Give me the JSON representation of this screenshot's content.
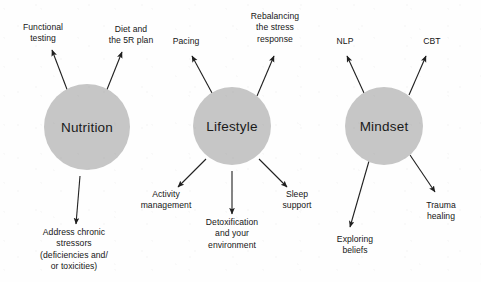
{
  "diagram": {
    "type": "radial-cluster",
    "title_visible": false,
    "background_color": "#fefefe",
    "node_fill_color": "#c6c6c6",
    "text_color": "#161616",
    "arrow_color": "#1f1f1f",
    "clusters": [
      {
        "id": "nutrition",
        "center_label": "Nutrition",
        "center": {
          "x": 87,
          "y": 127
        },
        "radius": 43,
        "branches": [
          {
            "id": "functional-testing",
            "lines": [
              "Functional",
              "testing"
            ],
            "label_pos": {
              "x": 43,
              "y": 33
            },
            "arrow": {
              "x1": 68,
              "y1": 92,
              "x2": 52,
              "y2": 50
            }
          },
          {
            "id": "diet-and-5r-plan",
            "lines": [
              "Diet and",
              "the 5R plan"
            ],
            "label_pos": {
              "x": 131,
              "y": 35
            },
            "arrow": {
              "x1": 106,
              "y1": 92,
              "x2": 122,
              "y2": 52
            }
          },
          {
            "id": "address-chronic-stressors",
            "lines": [
              "Address chronic",
              "stressors",
              "(deficiencies and/",
              "or toxicities)"
            ],
            "label_pos": {
              "x": 74,
              "y": 250
            },
            "arrow": {
              "x1": 80,
              "y1": 176,
              "x2": 76,
              "y2": 224
            }
          }
        ]
      },
      {
        "id": "lifestyle",
        "center_label": "Lifestyle",
        "center": {
          "x": 232,
          "y": 126
        },
        "radius": 39,
        "branches": [
          {
            "id": "pacing",
            "lines": [
              "Pacing"
            ],
            "label_pos": {
              "x": 186,
              "y": 42
            },
            "arrow": {
              "x1": 212,
              "y1": 93,
              "x2": 192,
              "y2": 56
            }
          },
          {
            "id": "rebalancing-stress-response",
            "lines": [
              "Rebalancing",
              "the stress",
              "response"
            ],
            "label_pos": {
              "x": 275,
              "y": 28
            },
            "arrow": {
              "x1": 257,
              "y1": 96,
              "x2": 274,
              "y2": 56
            }
          },
          {
            "id": "activity-management",
            "lines": [
              "Activity",
              "management"
            ],
            "label_pos": {
              "x": 166,
              "y": 200
            },
            "arrow": {
              "x1": 206,
              "y1": 159,
              "x2": 178,
              "y2": 187
            }
          },
          {
            "id": "detoxification-environment",
            "lines": [
              "Detoxification",
              "and your",
              "environment"
            ],
            "label_pos": {
              "x": 232,
              "y": 234
            },
            "arrow": {
              "x1": 232,
              "y1": 171,
              "x2": 232,
              "y2": 214
            }
          },
          {
            "id": "sleep-support",
            "lines": [
              "Sleep",
              "support"
            ],
            "label_pos": {
              "x": 297,
              "y": 200
            },
            "arrow": {
              "x1": 259,
              "y1": 159,
              "x2": 287,
              "y2": 187
            }
          }
        ]
      },
      {
        "id": "mindset",
        "center_label": "Mindset",
        "center": {
          "x": 384,
          "y": 126
        },
        "radius": 39,
        "branches": [
          {
            "id": "nlp",
            "lines": [
              "NLP"
            ],
            "label_pos": {
              "x": 345,
              "y": 42
            },
            "arrow": {
              "x1": 364,
              "y1": 93,
              "x2": 347,
              "y2": 56
            }
          },
          {
            "id": "cbt",
            "lines": [
              "CBT"
            ],
            "label_pos": {
              "x": 432,
              "y": 42
            },
            "arrow": {
              "x1": 409,
              "y1": 95,
              "x2": 426,
              "y2": 56
            }
          },
          {
            "id": "exploring-beliefs",
            "lines": [
              "Exploring",
              "beliefs"
            ],
            "label_pos": {
              "x": 355,
              "y": 245
            },
            "arrow": {
              "x1": 369,
              "y1": 161,
              "x2": 350,
              "y2": 227
            }
          },
          {
            "id": "trauma-healing",
            "lines": [
              "Trauma",
              "healing"
            ],
            "label_pos": {
              "x": 441,
              "y": 211
            },
            "arrow": {
              "x1": 410,
              "y1": 155,
              "x2": 435,
              "y2": 192
            }
          }
        ]
      }
    ]
  }
}
